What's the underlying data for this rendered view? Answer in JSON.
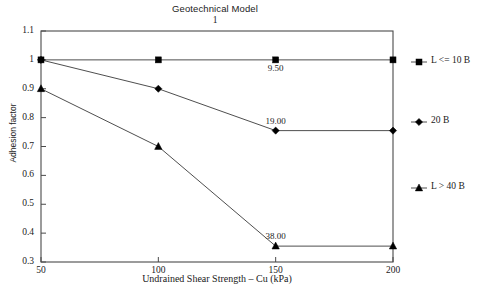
{
  "chart_data": {
    "type": "line",
    "title": "Geotechnical Model",
    "subtitle": "1",
    "xlabel": "Undrained Shear Strength – Cu (kPa)",
    "ylabel": "Adhesion factor",
    "x": [
      50,
      100,
      150,
      200
    ],
    "xtick_labels": [
      "50",
      "100",
      "150",
      "200"
    ],
    "ytick_labels": [
      "1.1",
      "1",
      "0.9",
      "0.8",
      "0.7",
      "0.6",
      "0.5",
      "0.4",
      "0.3"
    ],
    "ytick_values": [
      1.1,
      1.0,
      0.9,
      0.8,
      0.7,
      0.6,
      0.5,
      0.4,
      0.3
    ],
    "xlim": [
      50,
      200
    ],
    "ylim": [
      0.3,
      1.1
    ],
    "grid": false,
    "legend_position": "right",
    "line_color": "#3a3a3a",
    "marker_color": "#000000",
    "frame_color": "#4a4a4a",
    "series": [
      {
        "name": "L <= 10 B",
        "marker": "square",
        "values": [
          1.0,
          1.0,
          1.0,
          1.0
        ],
        "point_labels": [
          null,
          null,
          "9.50",
          null
        ]
      },
      {
        "name": "20 B",
        "marker": "diamond",
        "values": [
          1.0,
          0.9,
          0.755,
          0.755
        ],
        "point_labels": [
          null,
          null,
          "19.00",
          null
        ]
      },
      {
        "name": "L > 40 B",
        "marker": "triangle",
        "values": [
          0.9,
          0.7,
          0.355,
          0.355
        ],
        "point_labels": [
          null,
          null,
          "38.00",
          null
        ]
      }
    ],
    "annotations": [
      {
        "text": "9.50",
        "x": 150,
        "y": 1.0,
        "series": 0
      },
      {
        "text": "19.00",
        "x": 150,
        "y": 0.755,
        "series": 1
      },
      {
        "text": "38.00",
        "x": 150,
        "y": 0.355,
        "series": 2
      }
    ]
  }
}
